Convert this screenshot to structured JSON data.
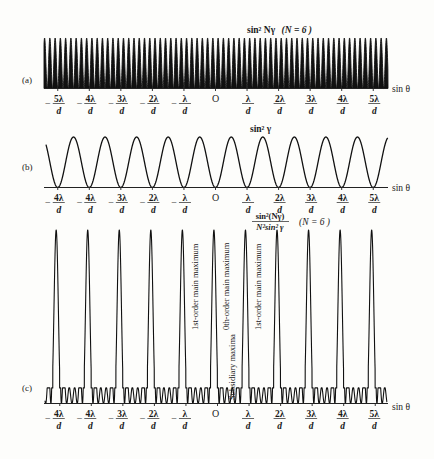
{
  "chart_data": [
    {
      "panel": "(a)",
      "type": "line",
      "title": "sin² Nγ (N = 6)",
      "function": "sin^2(N*gamma)",
      "N": 6,
      "xlabel": "sin θ",
      "ylabel": "",
      "tick_labels": [
        "−5λ/d",
        "−4λ/d",
        "−3λ/d",
        "−2λ/d",
        "−λ/d",
        "O",
        "λ/d",
        "2λ/d",
        "3λ/d",
        "4λ/d",
        "5λ/d"
      ],
      "x_range_in_lambda_over_d": [
        -5.4,
        5.5
      ],
      "ylim": [
        0,
        1
      ],
      "grid": false,
      "note": "rapid oscillation with period λ/(N d), 6 peaks per λ/d interval"
    },
    {
      "panel": "(b)",
      "type": "line",
      "title": "sin² γ",
      "function": "sin^2(gamma)",
      "xlabel": "sin θ",
      "ylabel": "",
      "tick_labels": [
        "−4λ/d",
        "−4λ/d",
        "−3λ/d",
        "−2λ/d",
        "−λ/d",
        "O",
        "λ/d",
        "2λ/d",
        "3λ/d",
        "4λ/d",
        "5λ/d"
      ],
      "x_range_in_lambda_over_d": [
        -5.35,
        5.5
      ],
      "ylim": [
        0,
        1
      ],
      "grid": false,
      "note": "minima at integer multiples of λ/d, maxima halfway between"
    },
    {
      "panel": "(c)",
      "type": "line",
      "title": "sin²(Nγ) / (N² sin² γ)  (N = 6)",
      "function": "sin^2(N*gamma)/(N^2*sin^2(gamma))",
      "N": 6,
      "xlabel": "sin θ",
      "ylabel": "",
      "tick_labels": [
        "−4λ/d",
        "−4λ/d",
        "−3λ/d",
        "−2λ/d",
        "−λ/d",
        "O",
        "λ/d",
        "2λ/d",
        "3λ/d",
        "4λ/d",
        "5λ/d"
      ],
      "x_range_in_lambda_over_d": [
        -5.35,
        5.5
      ],
      "ylim": [
        0,
        1
      ],
      "grid": false,
      "main_maxima_count": 11,
      "subsidiary_maxima_between_main": 4,
      "annotations": [
        "1st-order main maximum",
        "0th-order main maximum",
        "1st-order main maximum",
        "Subsidiary maxima"
      ]
    }
  ],
  "panels": {
    "a": {
      "label": "(a)",
      "title_main": "sin² Nγ",
      "title_param": "(N = 6 )",
      "axis_label": "sin θ",
      "ticks": [
        {
          "num": "5λ",
          "neg": true
        },
        {
          "num": "4λ",
          "neg": true
        },
        {
          "num": "3λ",
          "neg": true
        },
        {
          "num": "2λ",
          "neg": true
        },
        {
          "num": "λ",
          "neg": true
        },
        {
          "num": "O",
          "origin": true
        },
        {
          "num": "λ"
        },
        {
          "num": "2λ"
        },
        {
          "num": "3λ"
        },
        {
          "num": "4λ"
        },
        {
          "num": "5λ"
        }
      ]
    },
    "b": {
      "label": "(b)",
      "title_main": "sin² γ",
      "axis_label": "sin θ",
      "ticks": [
        {
          "num": "4λ",
          "neg": true
        },
        {
          "num": "4λ",
          "neg": true
        },
        {
          "num": "3λ",
          "neg": true
        },
        {
          "num": "2λ",
          "neg": true
        },
        {
          "num": "λ",
          "neg": true
        },
        {
          "num": "O",
          "origin": true
        },
        {
          "num": "λ"
        },
        {
          "num": "2λ"
        },
        {
          "num": "3λ"
        },
        {
          "num": "4λ"
        },
        {
          "num": "5λ"
        }
      ]
    },
    "c": {
      "label": "(c)",
      "formula_num": "sin²(Nγ)",
      "formula_den": "N²sin² γ",
      "title_param": "(N = 6 )",
      "axis_label": "sin θ",
      "annotations": {
        "first_order_left": "1st-order main maximum",
        "zeroth_order": "0th-order main maximum",
        "first_order_right": "1st-order main maximum",
        "subsidiary": "Subsidiary maxima"
      },
      "ticks": [
        {
          "num": "4λ",
          "neg": true
        },
        {
          "num": "4λ",
          "neg": true
        },
        {
          "num": "3λ",
          "neg": true
        },
        {
          "num": "2λ",
          "neg": true
        },
        {
          "num": "λ",
          "neg": true
        },
        {
          "num": "O",
          "origin": true
        },
        {
          "num": "λ"
        },
        {
          "num": "2λ"
        },
        {
          "num": "3λ"
        },
        {
          "num": "4λ"
        },
        {
          "num": "5λ"
        }
      ]
    },
    "denominator_symbol": "d",
    "minus_sign": "−"
  }
}
